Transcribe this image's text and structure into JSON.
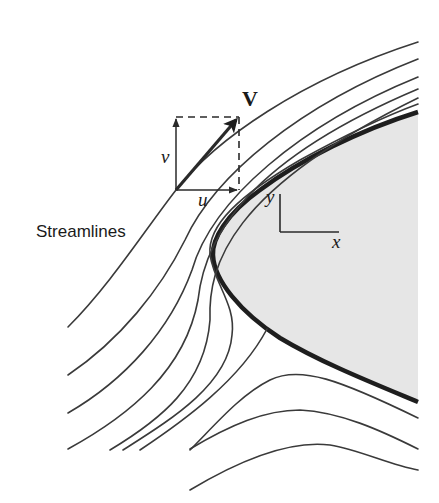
{
  "figure": {
    "labels": {
      "streamlines": "Streamlines",
      "velocity": "V",
      "u_component": "u",
      "v_component": "v",
      "x_axis": "x",
      "y_axis": "y"
    },
    "colors": {
      "background": "#ffffff",
      "body_fill": "#e6e6e6",
      "body_outline": "#1e1e1e",
      "streamline": "#3a3a3a"
    },
    "elements": [
      {
        "type": "solid-body",
        "shape": "blunt nose (parabolic)",
        "description": "gray-filled body with thick outline"
      },
      {
        "type": "streamlines",
        "count": 11,
        "description": "flow lines deflecting around the body"
      },
      {
        "type": "velocity-vector",
        "label": "V",
        "components": [
          "u",
          "v"
        ],
        "description": "velocity vector tangent to streamline, with dashed component box"
      },
      {
        "type": "axes",
        "labels": [
          "x",
          "y"
        ],
        "description": "coordinate axes drawn inside the body"
      }
    ]
  }
}
